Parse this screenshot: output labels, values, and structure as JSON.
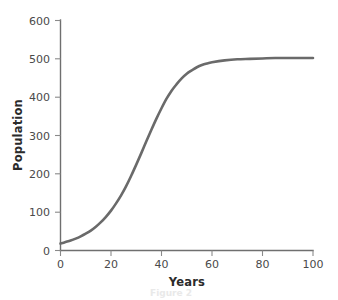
{
  "chart_data": {
    "type": "line",
    "title": "",
    "xlabel": "Years",
    "ylabel": "Population",
    "xlim": [
      0,
      100
    ],
    "ylim": [
      0,
      600
    ],
    "xticks": [
      0,
      20,
      40,
      60,
      80,
      100
    ],
    "yticks": [
      0,
      100,
      200,
      300,
      400,
      500,
      600
    ],
    "xtick_labels": [
      "0",
      "20",
      "40",
      "60",
      "80",
      "100"
    ],
    "ytick_labels": [
      "0",
      "100",
      "200",
      "300",
      "400",
      "500",
      "600"
    ],
    "grid": false,
    "legend": false,
    "legend_position": "none",
    "series": [
      {
        "name": "Population",
        "color": "#6a6a6a",
        "x": [
          0,
          2,
          4,
          6,
          8,
          10,
          12,
          14,
          16,
          18,
          20,
          22,
          24,
          26,
          28,
          30,
          32,
          34,
          36,
          38,
          40,
          42,
          44,
          46,
          48,
          50,
          52,
          54,
          56,
          58,
          60,
          65,
          70,
          75,
          80,
          85,
          90,
          95,
          100
        ],
        "y": [
          18,
          22,
          26,
          31,
          37,
          44,
          52,
          62,
          74,
          88,
          104,
          123,
          144,
          168,
          195,
          224,
          254,
          285,
          315,
          344,
          371,
          396,
          417,
          434,
          449,
          461,
          470,
          478,
          484,
          488,
          491,
          496,
          499,
          500,
          501,
          502,
          502,
          502,
          502
        ]
      }
    ],
    "annotations": {
      "initial_population": 18,
      "carrying_capacity": 502,
      "inflection_year": 28,
      "shape": "logistic-sigmoid"
    }
  },
  "figure": {
    "axis_color": "#6f6f6f",
    "tick_color": "#8a8a8a",
    "background": "#ffffff",
    "scan_artifact_text": "Figure 2"
  }
}
